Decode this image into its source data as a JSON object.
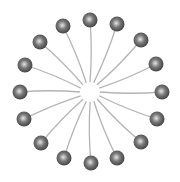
{
  "diagram": {
    "type": "micelle",
    "center": [
      90,
      92
    ],
    "colors": {
      "background": "#ffffff",
      "tail": "#b4b4b4",
      "head_dark": "#3c3c3c",
      "head_mid": "#7a7a7a",
      "head_light": "#e6e6e6"
    },
    "head_radius": 7.5,
    "tail_inner_radius": 10,
    "heads": [
      [
        90,
        20
      ],
      [
        117,
        24
      ],
      [
        141,
        40
      ],
      [
        156,
        64
      ],
      [
        162,
        92
      ],
      [
        157,
        119
      ],
      [
        141,
        142
      ],
      [
        117,
        158
      ],
      [
        91,
        163
      ],
      [
        64,
        158
      ],
      [
        41,
        143
      ],
      [
        24,
        119
      ],
      [
        20,
        92
      ],
      [
        25,
        65
      ],
      [
        40,
        42
      ],
      [
        63,
        26
      ]
    ]
  }
}
